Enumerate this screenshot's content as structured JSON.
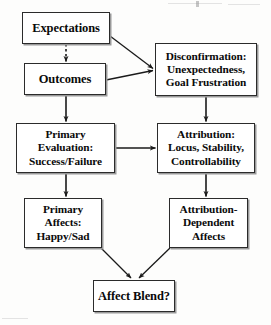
{
  "diagram": {
    "type": "flowchart",
    "background_color": "#fdfdfc",
    "box_border_color": "#2b2b2b",
    "text_color": "#0a0a0a",
    "arrow_color": "#1a1a1a",
    "nodes": [
      {
        "id": "expectations",
        "name": "expectations-node",
        "lines": [
          "Expectations"
        ]
      },
      {
        "id": "outcomes",
        "name": "outcomes-node",
        "lines": [
          "Outcomes"
        ]
      },
      {
        "id": "disconfirmation",
        "name": "disconfirmation-node",
        "lines": [
          "Disconfirmation:",
          "Unexpectedness,",
          "Goal Frustration"
        ]
      },
      {
        "id": "primary_evaluation",
        "name": "primary-evaluation-node",
        "lines": [
          "Primary",
          "Evaluation:",
          "Success/Failure"
        ]
      },
      {
        "id": "attribution",
        "name": "attribution-node",
        "lines": [
          "Attribution:",
          "Locus, Stability,",
          "Controllability"
        ]
      },
      {
        "id": "primary_affects",
        "name": "primary-affects-node",
        "lines": [
          "Primary",
          "Affects:",
          "Happy/Sad"
        ]
      },
      {
        "id": "attribution_dependent_affects",
        "name": "attribution-dependent-affects-node",
        "lines": [
          "Attribution-",
          "Dependent",
          "Affects"
        ]
      },
      {
        "id": "affect_blend",
        "name": "affect-blend-node",
        "lines": [
          "Affect Blend?"
        ]
      }
    ],
    "edges": [
      {
        "id": "e1",
        "from": "expectations",
        "to": "outcomes",
        "style": "dashed",
        "arrowhead": true
      },
      {
        "id": "e2",
        "from": "expectations",
        "to": "disconfirmation",
        "style": "solid",
        "arrowhead": true
      },
      {
        "id": "e3",
        "from": "outcomes",
        "to": "disconfirmation",
        "style": "solid",
        "arrowhead": true
      },
      {
        "id": "e4",
        "from": "outcomes",
        "to": "primary_evaluation",
        "style": "solid",
        "arrowhead": true
      },
      {
        "id": "e5",
        "from": "disconfirmation",
        "to": "attribution",
        "style": "solid",
        "arrowhead": true
      },
      {
        "id": "e6",
        "from": "primary_evaluation",
        "to": "attribution",
        "style": "solid",
        "arrowhead": true
      },
      {
        "id": "e7",
        "from": "primary_evaluation",
        "to": "primary_affects",
        "style": "solid",
        "arrowhead": true
      },
      {
        "id": "e8",
        "from": "attribution",
        "to": "attribution_dependent_affects",
        "style": "solid",
        "arrowhead": true
      },
      {
        "id": "e9",
        "from": "primary_affects",
        "to": "affect_blend",
        "style": "solid",
        "arrowhead": true
      },
      {
        "id": "e10",
        "from": "attribution_dependent_affects",
        "to": "affect_blend",
        "style": "solid",
        "arrowhead": true
      }
    ]
  }
}
